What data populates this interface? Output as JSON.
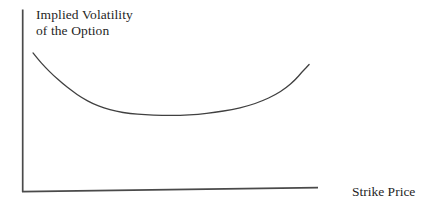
{
  "chart_data": {
    "type": "line",
    "title": "",
    "xlabel": "Strike Price",
    "ylabel": "Implied Volatility of the Option",
    "ylabel_lines": [
      "Implied Volatility",
      "of the Option"
    ],
    "x_axis": {
      "tick_labels": [],
      "range_normalized": [
        0,
        1
      ]
    },
    "y_axis": {
      "tick_labels": [],
      "range_normalized": [
        0,
        1
      ]
    },
    "grid": false,
    "legend_position": "none",
    "series": [
      {
        "name": "implied-volatility-smile",
        "shape_description": "Volatility smile: implied volatility starts high at low strike prices, declines to a shallow flat minimum slightly left of center, then curves upward steeply at high strike prices",
        "x_normalized": [
          0.035,
          0.052,
          0.077,
          0.105,
          0.136,
          0.171,
          0.206,
          0.244,
          0.282,
          0.324,
          0.373,
          0.425,
          0.484,
          0.547,
          0.61,
          0.669,
          0.728,
          0.784,
          0.833,
          0.878,
          0.916,
          0.948,
          0.972,
          0.997
        ],
        "y_normalized": [
          0.758,
          0.724,
          0.68,
          0.636,
          0.592,
          0.548,
          0.51,
          0.477,
          0.455,
          0.435,
          0.424,
          0.417,
          0.414,
          0.414,
          0.42,
          0.431,
          0.446,
          0.466,
          0.493,
          0.526,
          0.565,
          0.609,
          0.653,
          0.694
        ]
      }
    ],
    "colors": {
      "curve": "#404040",
      "axis": "#4a4a4a",
      "text": "#1f1f1f",
      "background": "#ffffff"
    }
  }
}
